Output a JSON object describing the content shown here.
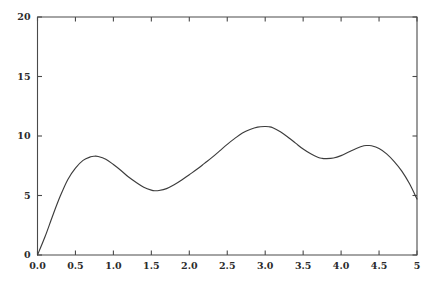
{
  "chart_data": {
    "type": "line",
    "title": "",
    "subtitle": "",
    "xlabel": "",
    "ylabel": "",
    "xlim": [
      0.0,
      5.0
    ],
    "ylim": [
      0,
      20
    ],
    "grid": false,
    "legend": null,
    "annotations": [],
    "x_ticks": [
      {
        "value": 0.0,
        "label": "0.0"
      },
      {
        "value": 0.5,
        "label": "0.5"
      },
      {
        "value": 1.0,
        "label": "1.0"
      },
      {
        "value": 1.5,
        "label": "1.5"
      },
      {
        "value": 2.0,
        "label": "2.0"
      },
      {
        "value": 2.5,
        "label": "2.5"
      },
      {
        "value": 3.0,
        "label": "3.0"
      },
      {
        "value": 3.5,
        "label": "3.5"
      },
      {
        "value": 4.0,
        "label": "4.0"
      },
      {
        "value": 4.5,
        "label": "4.5"
      },
      {
        "value": 5.0,
        "label": "5"
      }
    ],
    "y_ticks": [
      {
        "value": 0,
        "label": "0"
      },
      {
        "value": 5,
        "label": "5"
      },
      {
        "value": 10,
        "label": "10"
      },
      {
        "value": 15,
        "label": "15"
      },
      {
        "value": 20,
        "label": "20"
      }
    ],
    "series": [
      {
        "name": "curve",
        "color": "#3c3c3c",
        "x": [
          0.0,
          0.1,
          0.2,
          0.3,
          0.4,
          0.5,
          0.6,
          0.7,
          0.75,
          0.8,
          0.9,
          1.0,
          1.1,
          1.2,
          1.3,
          1.4,
          1.5,
          1.55,
          1.6,
          1.7,
          1.8,
          1.9,
          2.0,
          2.1,
          2.2,
          2.3,
          2.4,
          2.5,
          2.6,
          2.7,
          2.8,
          2.9,
          3.0,
          3.05,
          3.1,
          3.2,
          3.3,
          3.4,
          3.5,
          3.6,
          3.7,
          3.75,
          3.8,
          3.9,
          4.0,
          4.1,
          4.2,
          4.3,
          4.35,
          4.4,
          4.5,
          4.6,
          4.7,
          4.8,
          4.9,
          5.0
        ],
        "y": [
          0.0,
          1.55,
          3.3,
          4.95,
          6.35,
          7.3,
          7.95,
          8.25,
          8.3,
          8.28,
          8.05,
          7.6,
          7.1,
          6.55,
          6.1,
          5.7,
          5.45,
          5.4,
          5.42,
          5.58,
          5.9,
          6.3,
          6.75,
          7.2,
          7.7,
          8.2,
          8.75,
          9.3,
          9.8,
          10.25,
          10.55,
          10.75,
          10.8,
          10.78,
          10.7,
          10.35,
          9.9,
          9.4,
          8.9,
          8.5,
          8.2,
          8.12,
          8.1,
          8.15,
          8.35,
          8.65,
          8.95,
          9.18,
          9.2,
          9.18,
          8.95,
          8.5,
          7.85,
          7.05,
          6.0,
          4.7
        ]
      }
    ]
  },
  "figure": {
    "background_color": "#ffffff",
    "axis_color": "#4a4a4a",
    "text_color": "#2b2b2b"
  }
}
